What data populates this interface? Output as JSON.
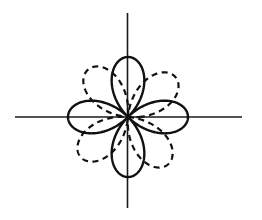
{
  "figure": {
    "background_color": "#ffffff",
    "stroke_color": "#111111",
    "width": 262,
    "height": 220
  },
  "axes": {
    "x_axis_label": "x-axis",
    "y_axis_label": "y-axis",
    "origin_x": 128,
    "origin_y": 117,
    "x_min": 15,
    "x_max": 242,
    "y_min": 13,
    "y_max": 208,
    "ticks": [],
    "tick_labels": [],
    "grid": "off"
  },
  "chart_data": {
    "type": "line",
    "subtitle": "",
    "xlabel": "",
    "ylabel": "",
    "coordinate_system": "polar",
    "xlim": [
      -113,
      114
    ],
    "ylim": [
      -91,
      104
    ],
    "grid": false,
    "legend": "none",
    "annotations": [],
    "series": [
      {
        "name": "solid-rose",
        "equation": "r = a*cos(2*theta)",
        "style": "solid",
        "color": "#111111",
        "amplitude_px": 60,
        "petal_count": 4,
        "rotation_deg": 0,
        "petal_tip_angles_deg": [
          45,
          135,
          225,
          315
        ],
        "petal_tips_px": [
          {
            "x": 170,
            "y": 75
          },
          {
            "x": 86,
            "y": 75
          },
          {
            "x": 86,
            "y": 159
          },
          {
            "x": 170,
            "y": 159
          }
        ]
      },
      {
        "name": "dashed-rose",
        "equation": "r = a*cos(2*(theta - 40deg))",
        "style": "dashed",
        "color": "#111111",
        "amplitude_px": 62,
        "petal_count": 4,
        "rotation_deg": 40,
        "petal_tip_angles_deg": [
          85,
          175,
          265,
          355
        ],
        "petal_tips_px": [
          {
            "x": 133,
            "y": 55
          },
          {
            "x": 66,
            "y": 112
          },
          {
            "x": 123,
            "y": 179
          },
          {
            "x": 190,
            "y": 122
          }
        ]
      }
    ],
    "theta_samples": 721,
    "theta_range_deg": [
      0,
      360
    ]
  }
}
